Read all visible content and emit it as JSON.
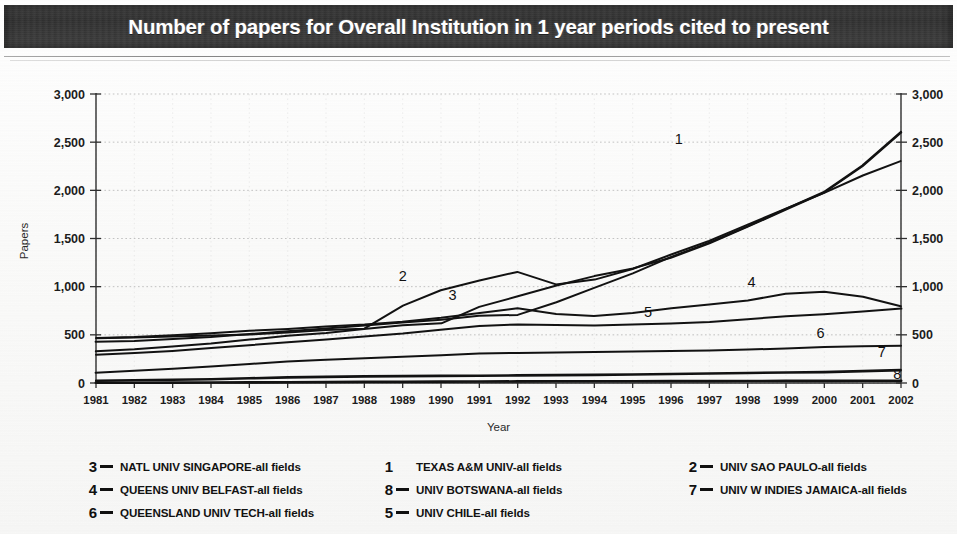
{
  "title": "Number of papers for Overall Institution in 1 year periods cited to present",
  "chart_data": {
    "type": "line",
    "title": "Number of papers for Overall Institution in 1 year periods cited to present",
    "xlabel": "Year",
    "ylabel": "Papers",
    "xlim": [
      1981,
      2002
    ],
    "ylim": [
      0,
      3000
    ],
    "ytick_labels": [
      "3,000",
      "2,500",
      "2,000",
      "1,500",
      "1,000",
      "500",
      "0"
    ],
    "ytick_values": [
      3000,
      2500,
      2000,
      1500,
      1000,
      500,
      0
    ],
    "right_axis": true,
    "right_ytick_labels": [
      "3,000",
      "2,500",
      "2,000",
      "1,500",
      "1,000",
      "500",
      "0"
    ],
    "grid": true,
    "legend_position": "bottom",
    "categories": [
      1981,
      1982,
      1983,
      1984,
      1985,
      1986,
      1987,
      1988,
      1989,
      1990,
      1991,
      1992,
      1993,
      1994,
      1995,
      1996,
      1997,
      1998,
      1999,
      2000,
      2001,
      2002
    ],
    "x": [
      1981,
      1982,
      1983,
      1984,
      1985,
      1986,
      1987,
      1988,
      1989,
      1990,
      1991,
      1992,
      1993,
      1994,
      1995,
      1996,
      1997,
      1998,
      1999,
      2000,
      2001,
      2002
    ],
    "series": [
      {
        "name": "TEXAS A&M UNIV-all fields",
        "label": "1",
        "values": [
          420,
          430,
          450,
          470,
          500,
          530,
          560,
          590,
          620,
          650,
          690,
          700,
          830,
          980,
          1130,
          1300,
          1450,
          1620,
          1800,
          1980,
          2250,
          2600
        ]
      },
      {
        "name": "UNIV SAO PAULO-all fields",
        "label": "2",
        "values": [
          460,
          470,
          480,
          490,
          500,
          520,
          545,
          560,
          800,
          960,
          1060,
          1150,
          1020,
          1070,
          1180,
          1330,
          1470,
          1640,
          1810,
          1970,
          2150,
          2300
        ]
      },
      {
        "name": "NATL UNIV SINGAPORE-all fields",
        "label": "3",
        "values": [
          330,
          350,
          380,
          410,
          450,
          490,
          520,
          560,
          600,
          620,
          790,
          900,
          1010,
          1110,
          1190,
          1300,
          1450,
          1620,
          1800,
          1980,
          2250,
          2600
        ]
      },
      {
        "name": "QUEENS UNIV BELFAST-all fields",
        "label": "4",
        "values": [
          470,
          480,
          500,
          520,
          545,
          565,
          590,
          610,
          640,
          680,
          730,
          780,
          720,
          700,
          730,
          780,
          820,
          860,
          930,
          950,
          900,
          800
        ]
      },
      {
        "name": "UNIV CHILE-all fields",
        "label": "5",
        "values": [
          300,
          320,
          340,
          370,
          400,
          430,
          460,
          490,
          520,
          560,
          600,
          615,
          610,
          605,
          615,
          625,
          640,
          670,
          700,
          720,
          750,
          780
        ]
      },
      {
        "name": "QUEENSLAND UNIV TECH-all fields",
        "label": "6",
        "values": [
          100,
          120,
          140,
          165,
          190,
          215,
          235,
          250,
          265,
          280,
          300,
          305,
          310,
          315,
          320,
          325,
          330,
          340,
          350,
          365,
          375,
          380
        ]
      },
      {
        "name": "UNIV W INDIES JAMAICA-all fields",
        "label": "7",
        "values": [
          20,
          25,
          30,
          35,
          45,
          55,
          60,
          65,
          68,
          70,
          72,
          75,
          78,
          80,
          85,
          90,
          95,
          100,
          105,
          110,
          120,
          130
        ]
      },
      {
        "name": "UNIV BOTSWANA-all fields",
        "label": "8",
        "values": [
          2,
          3,
          4,
          5,
          6,
          8,
          10,
          12,
          14,
          15,
          16,
          17,
          18,
          18,
          19,
          20,
          20,
          21,
          22,
          22,
          23,
          24
        ]
      }
    ],
    "inplot_labels": [
      {
        "text": "1",
        "x": 1996.2,
        "y": 2480
      },
      {
        "text": "2",
        "x": 1989.0,
        "y": 1060
      },
      {
        "text": "3",
        "x": 1990.3,
        "y": 860
      },
      {
        "text": "4",
        "x": 1998.1,
        "y": 1000
      },
      {
        "text": "5",
        "x": 1995.4,
        "y": 690
      },
      {
        "text": "6",
        "x": 1999.9,
        "y": 470
      },
      {
        "text": "7",
        "x": 2001.5,
        "y": 270
      },
      {
        "text": "8",
        "x": 2001.9,
        "y": 45
      }
    ]
  },
  "legend": {
    "columns": [
      {
        "entries": [
          {
            "num": "3",
            "dash": true,
            "label": "NATL UNIV SINGAPORE-all fields"
          },
          {
            "num": "4",
            "dash": true,
            "label": "QUEENS UNIV BELFAST-all fields"
          },
          {
            "num": "6",
            "dash": true,
            "label": "QUEENSLAND UNIV TECH-all fields"
          }
        ]
      },
      {
        "entries": [
          {
            "num": "1",
            "dash": false,
            "label": "TEXAS A&M UNIV-all fields"
          },
          {
            "num": "8",
            "dash": true,
            "label": "UNIV BOTSWANA-all fields"
          },
          {
            "num": "5",
            "dash": true,
            "label": "UNIV CHILE-all fields"
          }
        ]
      },
      {
        "entries": [
          {
            "num": "2",
            "dash": true,
            "label": "UNIV SAO PAULO-all fields"
          },
          {
            "num": "7",
            "dash": true,
            "label": "UNIV W INDIES JAMAICA-all fields"
          }
        ]
      }
    ]
  }
}
